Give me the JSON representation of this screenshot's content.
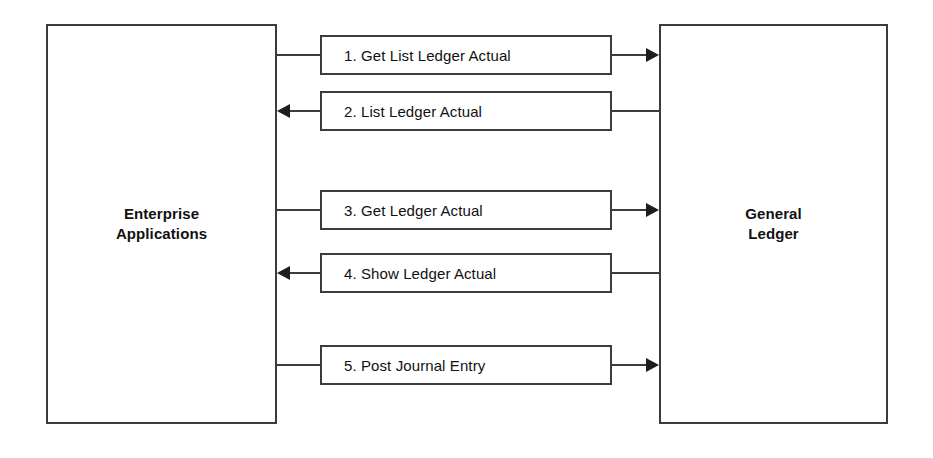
{
  "diagram": {
    "background_color": "#ffffff",
    "stroke_color": "#3c3c3c",
    "arrow_color": "#1d1d1d",
    "text_color": "#111111",
    "entities": {
      "left": {
        "name": "Enterprise Applications",
        "label": "Enterprise\nApplications"
      },
      "right": {
        "name": "General Ledger",
        "label": "General\nLedger"
      }
    },
    "messages": [
      {
        "number": "1.",
        "label": "1. Get List Ledger Actual",
        "direction": "right",
        "from": "Enterprise Applications",
        "to": "General Ledger"
      },
      {
        "number": "2.",
        "label": "2. List Ledger Actual",
        "direction": "left",
        "from": "General Ledger",
        "to": "Enterprise Applications"
      },
      {
        "number": "3.",
        "label": "3. Get Ledger Actual",
        "direction": "right",
        "from": "Enterprise Applications",
        "to": "General Ledger"
      },
      {
        "number": "4.",
        "label": "4. Show Ledger Actual",
        "direction": "left",
        "from": "General Ledger",
        "to": "Enterprise Applications"
      },
      {
        "number": "5.",
        "label": "5. Post Journal Entry",
        "direction": "right",
        "from": "Enterprise Applications",
        "to": "General Ledger"
      }
    ]
  }
}
